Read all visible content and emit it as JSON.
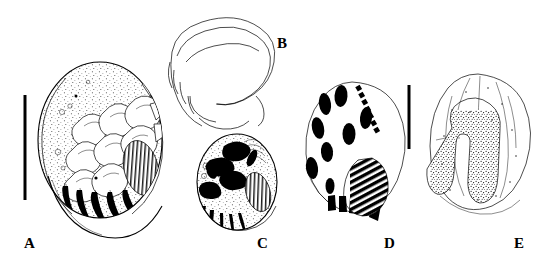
{
  "figure": {
    "kind": "scientific-illustration-plate",
    "medium": "pen-and-ink stipple drawing",
    "background_color": "#ffffff",
    "ink_color": "#000000",
    "width": 552,
    "height": 266,
    "panel_count": 5
  },
  "panels": [
    {
      "id": "A",
      "label": "A",
      "label_x": 30,
      "label_y": 247,
      "description": "Large stippled oval body with overlapping scale-like denticles and a row of curved black claws along the lower margin; hatched oval organ at right",
      "outline_cx": 100,
      "outline_cy": 140,
      "outline_rx": 62,
      "outline_ry": 78
    },
    {
      "id": "B",
      "label": "B",
      "label_x": 283,
      "label_y": 47,
      "description": "Curved hook-shaped outline drawn in fine line only, no stippling",
      "outline_cx": 220,
      "outline_cy": 62,
      "outline_rx": 58,
      "outline_ry": 42
    },
    {
      "id": "C",
      "label": "C",
      "label_x": 263,
      "label_y": 247,
      "description": "Smaller stippled oval body with dark internal sclerites, hatched oval organ at right and a fringe of black spines below",
      "outline_cx": 237,
      "outline_cy": 182,
      "outline_rx": 40,
      "outline_ry": 48
    },
    {
      "id": "D",
      "label": "D",
      "label_x": 390,
      "label_y": 247,
      "description": "Plain outline with solid black oval spots, an oblique dotted row, a row of black bars and a large obliquely striped teardrop patch",
      "outline_cx": 352,
      "outline_cy": 160,
      "outline_rx": 50,
      "outline_ry": 78
    },
    {
      "id": "E",
      "label": "E",
      "label_x": 520,
      "label_y": 247,
      "description": "Plain outline enclosing an inverted U-shaped (horseshoe) band filled with dense black stippling",
      "outline_cx": 478,
      "outline_cy": 155,
      "outline_rx": 52,
      "outline_ry": 82
    }
  ],
  "scale_bars": [
    {
      "name": "scale-bar-left",
      "x": 25,
      "y_top": 95,
      "y_bottom": 200,
      "length_px": 105,
      "orientation": "vertical",
      "color": "#000000",
      "thickness_px": 3,
      "serves_panels": "A B C"
    },
    {
      "name": "scale-bar-right",
      "x": 409,
      "y_top": 85,
      "y_bottom": 149,
      "length_px": 64,
      "orientation": "vertical",
      "color": "#000000",
      "thickness_px": 3,
      "serves_panels": "D E"
    }
  ],
  "panel_d_marks": {
    "ovals": [
      {
        "cx": 318,
        "cy": 128,
        "rx": 6,
        "ry": 11,
        "rot": -12
      },
      {
        "cx": 325,
        "cy": 104,
        "rx": 6,
        "ry": 11,
        "rot": -8
      },
      {
        "cx": 341,
        "cy": 96,
        "rx": 6.5,
        "ry": 11,
        "rot": 4
      },
      {
        "cx": 366,
        "cy": 118,
        "rx": 6,
        "ry": 11,
        "rot": 6
      },
      {
        "cx": 349,
        "cy": 134,
        "rx": 6.5,
        "ry": 11,
        "rot": 0
      },
      {
        "cx": 327,
        "cy": 152,
        "rx": 6,
        "ry": 10,
        "rot": -6
      },
      {
        "cx": 312,
        "cy": 168,
        "rx": 6,
        "ry": 11,
        "rot": -8
      },
      {
        "cx": 330,
        "cy": 186,
        "rx": 4.5,
        "ry": 8,
        "rot": 0
      }
    ],
    "dotted_row_count": 7,
    "bar_row_count": 5,
    "striped_patch": "oblique black hatching, teardrop outline, lower right"
  },
  "panel_e_marks": {
    "horseshoe": "inverted U band, dense black stipple fill, thin outline",
    "stipple_dots_approx": 260
  }
}
